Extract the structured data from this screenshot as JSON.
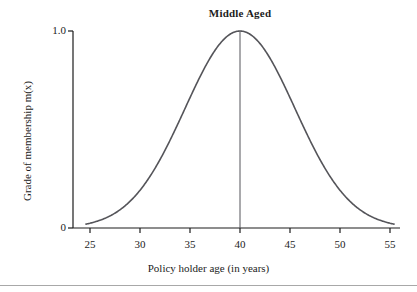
{
  "chart_data": {
    "type": "line",
    "title": "Middle Aged",
    "xlabel": "Policy holder age (in years)",
    "ylabel": "Grade of membership m(x)",
    "xlim": [
      23,
      56.5
    ],
    "ylim": [
      0,
      1.06
    ],
    "xticks": [
      25,
      30,
      35,
      40,
      45,
      50,
      55
    ],
    "xtick_labels": [
      "25",
      "30",
      "35",
      "40",
      "45",
      "50",
      "55"
    ],
    "yticks": [
      0,
      1.0
    ],
    "ytick_labels": [
      "0",
      "1.0"
    ],
    "grid": false,
    "legend": null,
    "curve_color": "#55555a",
    "axis_color": "#1c1c1c",
    "annotations": [
      {
        "name": "peak-reference-line",
        "type": "vline",
        "x": 40,
        "y_from": 0,
        "y_to": 1.0,
        "label": "Middle Aged"
      }
    ],
    "series": [
      {
        "name": "Middle Aged membership function",
        "description": "Gaussian membership function centred at age 40 with peak grade 1.0",
        "center": 40,
        "peak": 1.0,
        "sigma": 5.5,
        "x": [
          25,
          26,
          27,
          28,
          29,
          30,
          31,
          32,
          33,
          34,
          35,
          36,
          37,
          38,
          39,
          40,
          41,
          42,
          43,
          44,
          45,
          46,
          47,
          48,
          49,
          50,
          51,
          52,
          53,
          54,
          55
        ],
        "values": [
          0.01,
          0.02,
          0.03,
          0.05,
          0.07,
          0.11,
          0.16,
          0.22,
          0.3,
          0.39,
          0.49,
          0.6,
          0.71,
          0.81,
          0.9,
          1.0,
          0.9,
          0.81,
          0.71,
          0.6,
          0.49,
          0.39,
          0.3,
          0.22,
          0.16,
          0.11,
          0.07,
          0.05,
          0.03,
          0.02,
          0.01
        ]
      }
    ]
  }
}
